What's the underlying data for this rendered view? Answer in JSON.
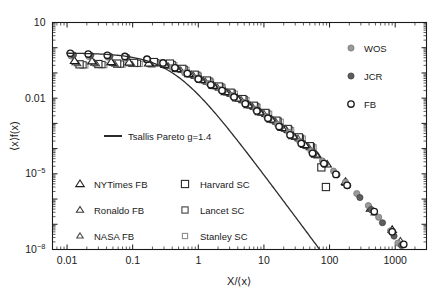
{
  "chart_data": {
    "type": "scatter",
    "title": "",
    "xlabel": "X/⟨x⟩",
    "ylabel": "⟨x⟩f(x)",
    "xscale": "log",
    "yscale": "log",
    "xlim": [
      0.006,
      3000
    ],
    "ylim": [
      1e-08,
      10
    ],
    "grid": false,
    "xticks": [
      "0.01",
      "0.1",
      "1",
      "10",
      "100",
      "1000"
    ],
    "xtick_values": [
      0.01,
      0.1,
      1,
      10,
      100,
      1000
    ],
    "yticks": [
      "10",
      "0.01",
      "10⁻⁵",
      "10⁻⁸"
    ],
    "ytick_values": [
      10,
      0.01,
      1e-05,
      1e-08
    ],
    "legend_position": "top-right and lower-left",
    "annotations": [],
    "fit": {
      "name": "Tsallis Pareto g=1.4",
      "label": "Tsallis Pareto g=1.4",
      "g": 1.4,
      "color": "#2b2b2b"
    },
    "series": [
      {
        "name": "WOS",
        "marker": "filled-circle",
        "color": "#9a9a9a",
        "edge": "#6e6e6e",
        "size": 6.2,
        "points": [
          [
            0.0115,
            0.47
          ],
          [
            0.0215,
            0.45
          ],
          [
            0.042,
            0.42
          ],
          [
            0.078,
            0.4
          ],
          [
            0.16,
            0.33
          ],
          [
            0.27,
            0.25
          ],
          [
            0.4,
            0.165
          ],
          [
            0.62,
            0.1
          ],
          [
            0.95,
            0.062
          ],
          [
            1.45,
            0.038
          ],
          [
            2.2,
            0.0215
          ],
          [
            3.3,
            0.0125
          ],
          [
            5.0,
            0.0068
          ],
          [
            7.4,
            0.0036
          ],
          [
            11.0,
            0.00185
          ],
          [
            16.0,
            0.00092
          ],
          [
            24.0,
            0.00044
          ],
          [
            35.0,
            0.000195
          ],
          [
            52.0,
            8.2e-05
          ],
          [
            78.0,
            3.25e-05
          ],
          [
            115.0,
            1.28e-05
          ],
          [
            175.0,
            4.7e-06
          ],
          [
            260.0,
            1.65e-06
          ],
          [
            390.0,
            5.5e-07
          ],
          [
            560.0,
            1.9e-07
          ],
          [
            850.0,
            5.5e-08
          ],
          [
            1100.0,
            1.8e-08
          ]
        ]
      },
      {
        "name": "JCR",
        "marker": "filled-circle",
        "color": "#5e5e5e",
        "edge": "#3a3a3a",
        "size": 6.2,
        "points": [
          [
            0.0125,
            0.52
          ],
          [
            0.023,
            0.5
          ],
          [
            0.045,
            0.46
          ],
          [
            0.082,
            0.42
          ],
          [
            0.17,
            0.34
          ],
          [
            0.3,
            0.245
          ],
          [
            0.45,
            0.155
          ],
          [
            0.7,
            0.092
          ],
          [
            1.05,
            0.056
          ],
          [
            1.6,
            0.033
          ],
          [
            2.4,
            0.019
          ],
          [
            3.6,
            0.0108
          ],
          [
            5.4,
            0.0058
          ],
          [
            8.0,
            0.003
          ],
          [
            12.0,
            0.00155
          ],
          [
            18.0,
            0.00072
          ],
          [
            26.0,
            0.00034
          ],
          [
            38.0,
            0.000155
          ],
          [
            58.0,
            6.2e-05
          ],
          [
            86.0,
            2.45e-05
          ],
          [
            130.0,
            9.2e-06
          ],
          [
            190.0,
            3.4e-06
          ],
          [
            290.0,
            1.15e-06
          ],
          [
            430.0,
            3.8e-07
          ],
          [
            640.0,
            1.15e-07
          ],
          [
            960.0,
            3.4e-08
          ],
          [
            1250.0,
            1.45e-08
          ]
        ]
      },
      {
        "name": "FB",
        "marker": "open-circle",
        "color": "#ffffff",
        "edge": "#1a1a1a",
        "size": 6.4,
        "points": [
          [
            0.0112,
            0.6
          ],
          [
            0.021,
            0.56
          ],
          [
            0.041,
            0.5
          ],
          [
            0.076,
            0.45
          ],
          [
            0.165,
            0.35
          ],
          [
            0.29,
            0.25
          ],
          [
            0.44,
            0.16
          ],
          [
            0.68,
            0.095
          ],
          [
            1.0,
            0.058
          ],
          [
            1.55,
            0.034
          ],
          [
            2.3,
            0.02
          ],
          [
            3.5,
            0.0112
          ],
          [
            5.2,
            0.006
          ],
          [
            7.8,
            0.0031
          ],
          [
            11.5,
            0.0016
          ],
          [
            17.0,
            0.00075
          ],
          [
            25.0,
            0.00035
          ],
          [
            37.0,
            0.00016
          ],
          [
            55.0,
            6.5e-05
          ],
          [
            82.0,
            2.55e-05
          ],
          [
            125.0,
            9.5e-06
          ],
          [
            185.0,
            3.5e-06
          ],
          [
            480.0,
            3.2e-07
          ],
          [
            900.0,
            5e-08
          ],
          [
            1350.0,
            1.6e-08
          ]
        ]
      },
      {
        "name": "NYTimes FB",
        "marker": "open-triangle",
        "color": "#ffffff",
        "edge": "#1a1a1a",
        "size": 7.0,
        "points": [
          [
            0.013,
            0.3
          ],
          [
            0.024,
            0.29
          ],
          [
            0.047,
            0.27
          ],
          [
            0.088,
            0.26
          ],
          [
            0.175,
            0.24
          ],
          [
            0.31,
            0.21
          ],
          [
            0.47,
            0.145
          ],
          [
            0.72,
            0.09
          ],
          [
            1.1,
            0.053
          ],
          [
            1.7,
            0.031
          ],
          [
            2.6,
            0.0175
          ],
          [
            3.9,
            0.0098
          ],
          [
            5.8,
            0.0053
          ],
          [
            8.6,
            0.0028
          ],
          [
            13.0,
            0.00142
          ],
          [
            19.0,
            0.00066
          ],
          [
            28.0,
            0.00031
          ],
          [
            42.0,
            0.00014
          ],
          [
            62.0,
            5.8e-05
          ],
          [
            92.0,
            2.35e-05
          ],
          [
            175.0,
            4.8e-06
          ],
          [
            420.0,
            4.2e-07
          ],
          [
            900.0,
            6e-08
          ]
        ]
      },
      {
        "name": "Ronaldo FB",
        "marker": "open-triangle",
        "color": "#ffffff",
        "edge": "#3a3a3a",
        "size": 6.0,
        "points": [
          [
            0.0135,
            0.26
          ],
          [
            0.026,
            0.25
          ],
          [
            0.05,
            0.24
          ],
          [
            0.092,
            0.235
          ],
          [
            0.185,
            0.225
          ],
          [
            0.33,
            0.195
          ],
          [
            0.5,
            0.138
          ],
          [
            0.78,
            0.086
          ],
          [
            1.18,
            0.05
          ],
          [
            1.8,
            0.029
          ],
          [
            2.8,
            0.0165
          ],
          [
            4.2,
            0.0092
          ],
          [
            6.2,
            0.005
          ],
          [
            9.2,
            0.0026
          ],
          [
            14.0,
            0.0013
          ],
          [
            21.0,
            0.0006
          ],
          [
            30.0,
            0.00028
          ],
          [
            45.0,
            0.000125
          ],
          [
            66.0,
            5.2e-05
          ],
          [
            175.0,
            4.2e-06
          ],
          [
            1200.0,
            2.2e-08
          ]
        ]
      },
      {
        "name": "NASA FB",
        "marker": "open-triangle",
        "color": "#ffffff",
        "edge": "#4a4a4a",
        "size": 5.4,
        "points": [
          [
            0.0145,
            0.23
          ],
          [
            0.028,
            0.225
          ],
          [
            0.054,
            0.22
          ],
          [
            0.098,
            0.215
          ],
          [
            0.195,
            0.205
          ],
          [
            0.35,
            0.185
          ],
          [
            0.54,
            0.13
          ],
          [
            0.84,
            0.082
          ],
          [
            1.28,
            0.047
          ],
          [
            1.95,
            0.0275
          ],
          [
            3.0,
            0.0155
          ],
          [
            4.5,
            0.0088
          ],
          [
            6.7,
            0.0047
          ],
          [
            10.0,
            0.0025
          ],
          [
            15.0,
            0.00122
          ],
          [
            22.0,
            0.00057
          ],
          [
            33.0,
            0.00026
          ],
          [
            48.0,
            0.000118
          ],
          [
            480.0,
            2.8e-07
          ]
        ]
      },
      {
        "name": "Harvard SC",
        "marker": "open-square",
        "color": "#ffffff",
        "edge": "#2a2a2a",
        "size": 7.2,
        "points": [
          [
            0.0155,
            0.22
          ],
          [
            0.03,
            0.225
          ],
          [
            0.058,
            0.235
          ],
          [
            0.105,
            0.25
          ],
          [
            0.21,
            0.27
          ],
          [
            0.37,
            0.235
          ],
          [
            0.57,
            0.145
          ],
          [
            0.88,
            0.085
          ],
          [
            1.35,
            0.05
          ],
          [
            2.05,
            0.029
          ],
          [
            3.1,
            0.0165
          ],
          [
            4.7,
            0.0092
          ],
          [
            7.0,
            0.005
          ],
          [
            10.5,
            0.0026
          ],
          [
            15.5,
            0.00128
          ],
          [
            23.0,
            0.0006
          ],
          [
            34.0,
            0.00028
          ],
          [
            50.0,
            0.000125
          ],
          [
            75.0,
            1.8e-05
          ],
          [
            88.0,
            3e-06
          ]
        ]
      },
      {
        "name": "Lancet SC",
        "marker": "open-square",
        "color": "#ffffff",
        "edge": "#3f3f3f",
        "size": 6.2,
        "points": [
          [
            0.0175,
            0.21
          ],
          [
            0.034,
            0.215
          ],
          [
            0.065,
            0.225
          ],
          [
            0.118,
            0.24
          ],
          [
            0.225,
            0.255
          ],
          [
            0.4,
            0.215
          ],
          [
            0.61,
            0.138
          ],
          [
            0.95,
            0.082
          ],
          [
            1.45,
            0.048
          ],
          [
            2.2,
            0.028
          ],
          [
            3.3,
            0.0158
          ],
          [
            5.0,
            0.0088
          ],
          [
            7.5,
            0.0047
          ],
          [
            11.0,
            0.0025
          ],
          [
            16.5,
            0.00122
          ],
          [
            24.0,
            0.00057
          ],
          [
            36.0,
            0.00026
          ],
          [
            53.0,
            0.000118
          ]
        ]
      },
      {
        "name": "Stanley SC",
        "marker": "open-square",
        "color": "#ffffff",
        "edge": "#8c8c8c",
        "size": 5.2,
        "points": [
          [
            0.019,
            0.2
          ],
          [
            0.037,
            0.205
          ],
          [
            0.07,
            0.215
          ],
          [
            0.128,
            0.228
          ],
          [
            0.24,
            0.24
          ],
          [
            0.43,
            0.205
          ],
          [
            0.66,
            0.132
          ],
          [
            1.02,
            0.078
          ],
          [
            1.56,
            0.046
          ],
          [
            2.35,
            0.027
          ],
          [
            3.6,
            0.015
          ],
          [
            5.4,
            0.0084
          ],
          [
            8.0,
            0.0045
          ],
          [
            12.0,
            0.0024
          ],
          [
            18.0,
            0.00116
          ],
          [
            26.0,
            0.00054
          ],
          [
            39.0,
            0.00025
          ],
          [
            57.0,
            0.000112
          ]
        ]
      }
    ]
  },
  "legend_top": {
    "items": [
      {
        "label": "WOS",
        "marker": "filled-circle",
        "color": "#9a9a9a",
        "edge": "#6e6e6e",
        "size": 6.2
      },
      {
        "label": "JCR",
        "marker": "filled-circle",
        "color": "#5e5e5e",
        "edge": "#3a3a3a",
        "size": 6.2
      },
      {
        "label": "FB",
        "marker": "open-circle",
        "color": "#ffffff",
        "edge": "#1a1a1a",
        "size": 6.4
      }
    ]
  },
  "legend_fit": {
    "label": "Tsallis Pareto g=1.4",
    "marker": "line",
    "color": "#2b2b2b"
  },
  "legend_bottom_left": {
    "items": [
      {
        "label": "NYTimes FB",
        "marker": "open-triangle",
        "color": "#ffffff",
        "edge": "#1a1a1a",
        "size": 7.0
      },
      {
        "label": "Ronaldo FB",
        "marker": "open-triangle",
        "color": "#ffffff",
        "edge": "#3a3a3a",
        "size": 6.0
      },
      {
        "label": "NASA FB",
        "marker": "open-triangle",
        "color": "#ffffff",
        "edge": "#4a4a4a",
        "size": 5.4
      }
    ]
  },
  "legend_bottom_right": {
    "items": [
      {
        "label": "Harvard SC",
        "marker": "open-square",
        "color": "#ffffff",
        "edge": "#2a2a2a",
        "size": 7.2
      },
      {
        "label": "Lancet SC",
        "marker": "open-square",
        "color": "#ffffff",
        "edge": "#3f3f3f",
        "size": 6.2
      },
      {
        "label": "Stanley SC",
        "marker": "open-square",
        "color": "#ffffff",
        "edge": "#8c8c8c",
        "size": 5.2
      }
    ]
  },
  "axes": {
    "x_title": "X/⟨x⟩",
    "y_title": "⟨x⟩f(x)",
    "x_tick_labels": [
      "0.01",
      "0.1",
      "1",
      "10",
      "100",
      "1000"
    ],
    "y_tick_labels": [
      {
        "mantissa": "10",
        "sup": ""
      },
      {
        "mantissa": "0.01",
        "sup": ""
      },
      {
        "mantissa": "10",
        "sup": "-5"
      },
      {
        "mantissa": "10",
        "sup": "-8"
      }
    ]
  }
}
